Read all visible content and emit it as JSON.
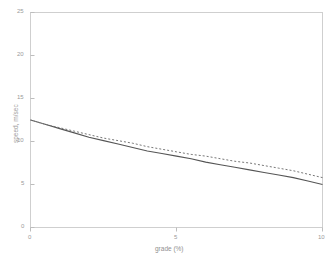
{
  "chart_data": {
    "type": "line",
    "title": "",
    "xlabel": "grade (%)",
    "ylabel": "speed, m/sec",
    "xlim": [
      0,
      10
    ],
    "ylim": [
      0,
      25
    ],
    "xticks": [
      0,
      5,
      10
    ],
    "xtick_labels": [
      "0",
      "5",
      "10"
    ],
    "yticks": [
      0,
      5,
      10,
      15,
      20,
      25
    ],
    "ytick_labels": [
      "0",
      "5",
      "10",
      "15",
      "20",
      "25"
    ],
    "grid": false,
    "legend": "none",
    "x": [
      0,
      0.5,
      1,
      1.5,
      2,
      2.5,
      3,
      3.5,
      4,
      4.5,
      5,
      5.5,
      6,
      6.5,
      7,
      7.5,
      8,
      8.5,
      9,
      9.5,
      10
    ],
    "series": [
      {
        "name": "solid-curve",
        "style": "solid",
        "color": "#555555",
        "values": [
          12.5,
          12.0,
          11.5,
          11.0,
          10.5,
          10.1,
          9.7,
          9.3,
          8.9,
          8.6,
          8.3,
          8.0,
          7.6,
          7.3,
          7.0,
          6.7,
          6.4,
          6.1,
          5.8,
          5.4,
          5.0
        ]
      },
      {
        "name": "dotted-curve",
        "style": "dotted",
        "color": "#777777",
        "values": [
          12.5,
          12.0,
          11.6,
          11.2,
          10.8,
          10.4,
          10.1,
          9.8,
          9.4,
          9.1,
          8.8,
          8.5,
          8.3,
          8.0,
          7.7,
          7.5,
          7.2,
          6.9,
          6.6,
          6.2,
          5.8
        ]
      }
    ]
  },
  "axes": {
    "frame_color": "#cfcfcf",
    "tick_color": "#bdbdbd",
    "label_color": "#9a9a9a",
    "background": "#ffffff"
  }
}
